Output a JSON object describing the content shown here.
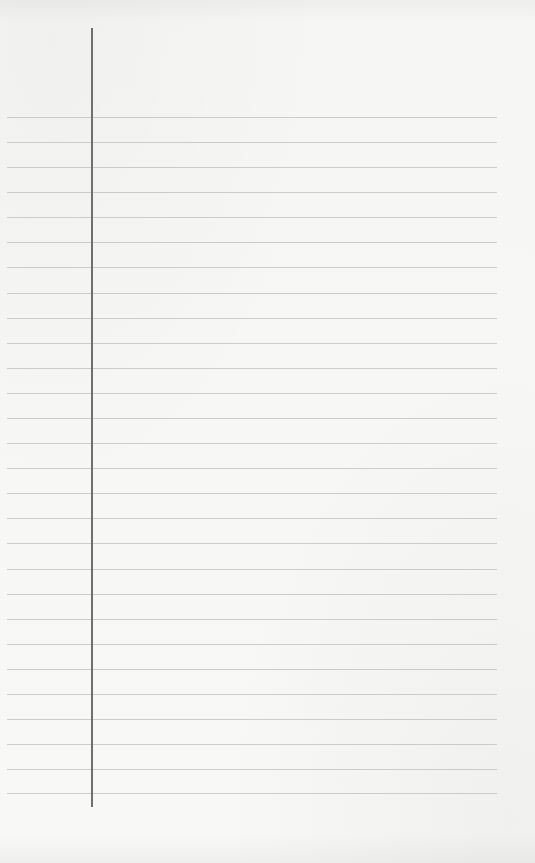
{
  "page": {
    "type": "ruled-notebook-sheet",
    "background_color": "#f7f7f6",
    "rule_color": "#c4c4c4",
    "margin_color": "#6f6f6f",
    "content": ""
  },
  "margin_line": {
    "x": 91,
    "y_start": 28,
    "y_end": 807
  },
  "rules": {
    "x_start": 7,
    "x_end": 497,
    "y_positions": [
      117,
      142,
      167,
      192,
      217,
      242,
      267,
      293,
      318,
      343,
      368,
      393,
      418,
      443,
      468,
      493,
      518,
      543,
      569,
      594,
      619,
      644,
      669,
      694,
      719,
      744,
      769,
      793
    ]
  }
}
